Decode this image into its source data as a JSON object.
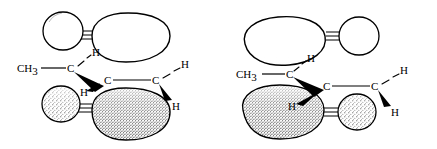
{
  "figure": {
    "type": "chemical-structure-diagram",
    "background_color": "#ffffff",
    "ink_color": "#000000",
    "structures": [
      {
        "id": "left-structure",
        "name": "left-orbital-structure",
        "orbital_arrangement": "large-lobes-right",
        "labels": {
          "methyl": "CH",
          "methyl_subscript": "3",
          "carbon_1": "C",
          "carbon_2": "C",
          "carbon_3": "C",
          "hydrogen_top": "H",
          "hydrogen_mid": "H",
          "hydrogen_upper_right": "H",
          "hydrogen_lower_right": "H"
        },
        "bonds": [
          {
            "kind": "plain-line",
            "from": "methyl",
            "to": "carbon_1"
          },
          {
            "kind": "plain-line",
            "from": "carbon_2",
            "to": "carbon_3"
          },
          {
            "kind": "dashed-line",
            "from": "carbon_1",
            "to": "hydrogen_top"
          },
          {
            "kind": "dashed-line",
            "from": "carbon_3",
            "to": "hydrogen_upper_right"
          },
          {
            "kind": "solid-wedge",
            "from": "carbon_1",
            "to": "carbon_2"
          },
          {
            "kind": "solid-wedge",
            "from": "carbon_2",
            "to": "hydrogen_mid"
          },
          {
            "kind": "solid-wedge",
            "from": "carbon_3",
            "to": "hydrogen_lower_right"
          }
        ],
        "lobes": [
          {
            "kind": "small-sphere",
            "position": "upper-left"
          },
          {
            "kind": "large-lobe",
            "position": "upper-right"
          },
          {
            "kind": "small-sphere",
            "position": "lower-left"
          },
          {
            "kind": "large-lobe",
            "position": "lower-right"
          }
        ]
      },
      {
        "id": "right-structure",
        "name": "right-orbital-structure",
        "orbital_arrangement": "large-lobes-left",
        "labels": {
          "methyl": "CH",
          "methyl_subscript": "3",
          "carbon_1": "C",
          "carbon_2": "C",
          "carbon_3": "C",
          "hydrogen_top": "H",
          "hydrogen_mid": "H",
          "hydrogen_upper_right": "H",
          "hydrogen_lower_right": "H"
        },
        "bonds": [
          {
            "kind": "plain-line",
            "from": "methyl",
            "to": "carbon_1"
          },
          {
            "kind": "plain-line",
            "from": "carbon_2",
            "to": "carbon_3"
          },
          {
            "kind": "dashed-line",
            "from": "carbon_1",
            "to": "hydrogen_top"
          },
          {
            "kind": "dashed-line",
            "from": "carbon_3",
            "to": "hydrogen_upper_right"
          },
          {
            "kind": "solid-wedge",
            "from": "carbon_1",
            "to": "carbon_2"
          },
          {
            "kind": "solid-wedge",
            "from": "carbon_2",
            "to": "hydrogen_mid"
          },
          {
            "kind": "solid-wedge",
            "from": "carbon_3",
            "to": "hydrogen_lower_right"
          }
        ],
        "lobes": [
          {
            "kind": "large-lobe",
            "position": "upper-left"
          },
          {
            "kind": "small-sphere",
            "position": "upper-right"
          },
          {
            "kind": "large-lobe",
            "position": "lower-left"
          },
          {
            "kind": "small-sphere",
            "position": "lower-right"
          }
        ]
      }
    ]
  }
}
